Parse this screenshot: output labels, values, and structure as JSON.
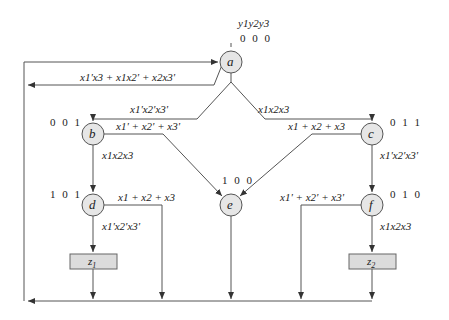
{
  "header": {
    "outputs_label": [
      "y1",
      "y2",
      "y3"
    ]
  },
  "states": [
    {
      "id": "a",
      "label": "a",
      "code": "0 0 0"
    },
    {
      "id": "b",
      "label": "b",
      "code": "0 0 1"
    },
    {
      "id": "c",
      "label": "c",
      "code": "0 1 1"
    },
    {
      "id": "d",
      "label": "d",
      "code": "1 0 1"
    },
    {
      "id": "e",
      "label": "e",
      "code": "1 0 0"
    },
    {
      "id": "f",
      "label": "f",
      "code": "0 1 0"
    }
  ],
  "outputs": [
    {
      "id": "z1",
      "label": "z",
      "sub": "1"
    },
    {
      "id": "z2",
      "label": "z",
      "sub": "2"
    }
  ],
  "transitions": {
    "a_return": "x1'x3 + x1x2' + x2x3'",
    "a_to_b": "x1'x2'x3'",
    "a_to_c": "x1x2x3",
    "b_to_e": "x1' + x2' + x3'",
    "b_to_d": "x1x2x3",
    "c_to_e": "x1 + x2 + x3",
    "c_to_f": "x1'x2'x3'",
    "d_exit": "x1 + x2 + x3",
    "d_to_z1": "x1'x2'x3'",
    "f_exit": "x1' + x2' + x3'",
    "f_to_z2": "x1x2x3"
  },
  "colors": {
    "line": "#555555",
    "state_fill": "#e6e6e6",
    "output_fill": "#dcdcdc"
  }
}
